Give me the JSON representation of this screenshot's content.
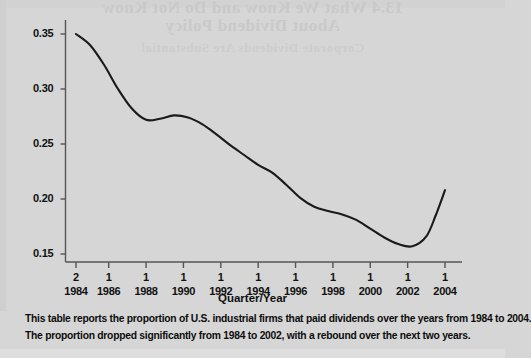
{
  "ghost_text": {
    "line1": "13.4 What We Know and Do Not Know",
    "line2": "About Dividend Policy",
    "line3": "Corporate Dividends Are Substantial"
  },
  "caption": {
    "line1": "This table reports the proportion of U.S. industrial firms that paid dividends over the years from 1984 to 2004.",
    "line2": "The proportion dropped significantly from 1984 to 2002, with a rebound over the next two years."
  },
  "chart_data": {
    "type": "line",
    "title": "",
    "xlabel": "Quarter/Year",
    "ylabel": "",
    "ylim": [
      0.13,
      0.362
    ],
    "xlim": [
      1984.25,
      2004.25
    ],
    "grid": false,
    "legend": null,
    "line_color": "#1a1a1a",
    "background_color": "#d6d6d6",
    "axis_color": "#555555",
    "ytick_labels": [
      "0.35",
      "0.30",
      "0.25",
      "0.20",
      "0.15"
    ],
    "ytick_values": [
      0.35,
      0.3,
      0.25,
      0.2,
      0.15
    ],
    "xtick_quarters": [
      "2",
      "1",
      "1",
      "1",
      "1",
      "1",
      "1",
      "1",
      "1",
      "1",
      "1"
    ],
    "xtick_years": [
      "1984",
      "1986",
      "1988",
      "1990",
      "1992",
      "1994",
      "1996",
      "1998",
      "2000",
      "2002",
      "2004"
    ],
    "xtick_values": [
      1984.25,
      1986.0,
      1988.0,
      1990.0,
      1992.0,
      1994.0,
      1996.0,
      1998.0,
      2000.0,
      2002.0,
      2004.0
    ],
    "x": [
      1984.25,
      1985.0,
      1985.75,
      1986.5,
      1987.25,
      1988.0,
      1988.75,
      1989.5,
      1990.25,
      1991.0,
      1991.75,
      1992.5,
      1993.25,
      1994.0,
      1994.75,
      1995.5,
      1996.25,
      1997.0,
      1997.75,
      1998.5,
      1999.25,
      2000.0,
      2000.75,
      2001.5,
      2002.25,
      2003.0,
      2003.5,
      2004.0
    ],
    "values": [
      0.35,
      0.34,
      0.322,
      0.3,
      0.282,
      0.272,
      0.273,
      0.276,
      0.274,
      0.268,
      0.259,
      0.249,
      0.24,
      0.231,
      0.224,
      0.213,
      0.201,
      0.193,
      0.189,
      0.186,
      0.181,
      0.173,
      0.165,
      0.159,
      0.157,
      0.166,
      0.185,
      0.208
    ],
    "annotations": [
      {
        "label": "start 1984 Q2",
        "x": 1984.25,
        "y": 0.35
      },
      {
        "label": "plateau 1988-1990",
        "x": 1989.5,
        "y": 0.276
      },
      {
        "label": "shoulder 1998",
        "x": 1998.5,
        "y": 0.186
      },
      {
        "label": "minimum 2002",
        "x": 2002.25,
        "y": 0.157
      },
      {
        "label": "end 2004 Q1",
        "x": 2004.0,
        "y": 0.208
      }
    ]
  }
}
